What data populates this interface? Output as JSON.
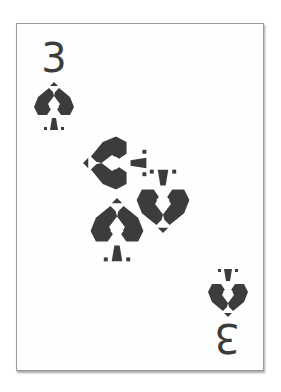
{
  "card": {
    "rank": "3",
    "suit": "spades",
    "suit_icon": "spade-icon",
    "pip_count": 3,
    "colors": {
      "ink": "#3c3c3c",
      "background": "#fefefe",
      "border": "#9a9a9a"
    }
  },
  "corners": {
    "top_left": {
      "rank": "3",
      "suit_icon": "spade-icon",
      "orientation": "upright"
    },
    "bottom_right": {
      "rank": "3",
      "suit_icon": "spade-icon",
      "orientation": "inverted"
    }
  },
  "center_pips": [
    {
      "suit_icon": "spade-icon",
      "orientation": "rotated-left"
    },
    {
      "suit_icon": "spade-icon",
      "orientation": "inverted"
    },
    {
      "suit_icon": "spade-icon",
      "orientation": "upright"
    }
  ]
}
